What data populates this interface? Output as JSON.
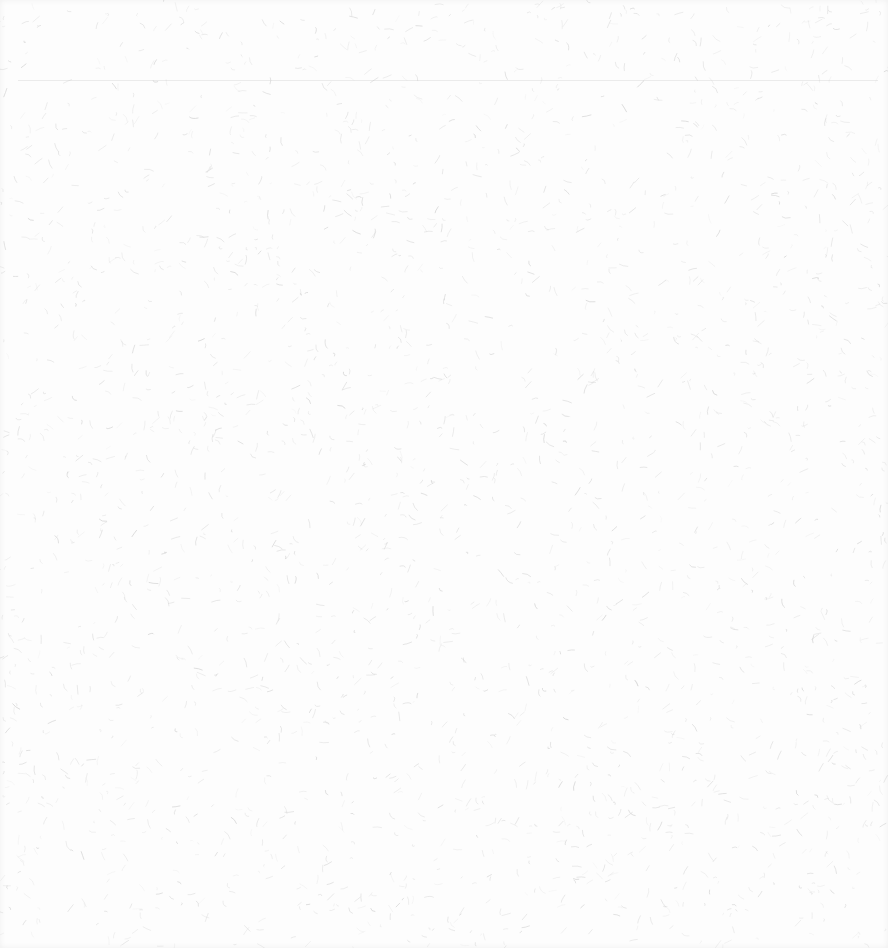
{
  "page": {
    "background_color": "#fdfdfd",
    "fiber_color": "#cfcfcf",
    "fiber_count": 2600,
    "faint_rule": {
      "visible": true,
      "y": 80
    }
  }
}
